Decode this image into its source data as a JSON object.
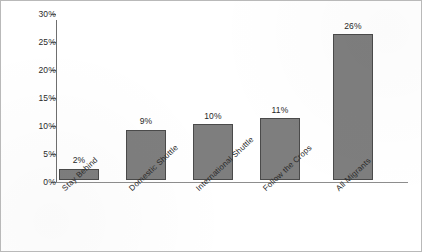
{
  "chart_data": {
    "type": "bar",
    "title": "",
    "subtitle": "",
    "xlabel": "",
    "ylabel": "",
    "categories": [
      "Stay Behind",
      "Domestic Shuttle",
      "International Shuttle",
      "Follow the Crops",
      "All Migrants"
    ],
    "values": [
      2,
      9,
      10,
      11,
      26
    ],
    "value_labels": [
      "2%",
      "9%",
      "10%",
      "11%",
      "26%"
    ],
    "ylim": [
      0,
      30
    ],
    "ytick_values": [
      30,
      25,
      20,
      15,
      10,
      5,
      0
    ],
    "ytick_labels": [
      "30%",
      "25%",
      "20%",
      "15%",
      "10%",
      "5%",
      "0%"
    ],
    "grid": false,
    "legend": false,
    "legend_position": "none",
    "series": [
      {
        "name": "Percent",
        "values": [
          2,
          9,
          10,
          11,
          26
        ]
      }
    ],
    "colors": {
      "bar_fill": "#7e7e7e",
      "bar_border": "#4a4a4a",
      "axis": "#6f6f6f",
      "text": "#272727",
      "background": "#ffffff",
      "frame_border": "#b9b9b9"
    }
  }
}
